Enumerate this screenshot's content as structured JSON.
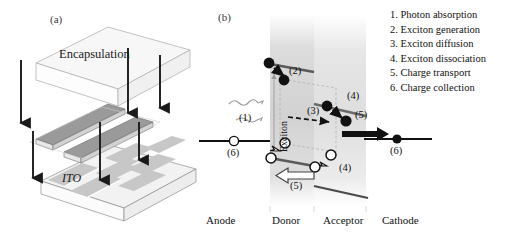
{
  "figure": {
    "panel_a": {
      "letter": "(a)",
      "encapsulation_label": "Encapsulation",
      "ito_label": "ITO",
      "arrow_count": 6,
      "description": "exploded isometric device stack with downward assembly arrows"
    },
    "panel_b": {
      "letter": "(b)",
      "exciton_label": "Exciton",
      "axis_labels": [
        "Anode",
        "Donor",
        "Acceptor",
        "Cathode"
      ],
      "step_markers": [
        "(1)",
        "(2)",
        "(3)",
        "(4)",
        "(4)",
        "(5)",
        "(5)",
        "(6)",
        "(6)"
      ],
      "marker_left_1": "(1)",
      "marker_2": "(2)",
      "marker_3": "(3)",
      "marker_4a": "(4)",
      "marker_4b": "(4)",
      "marker_5_holes": "(5)",
      "marker_5_electrons": "(5)",
      "marker_6_anode": "(6)",
      "marker_6_cathode": "(6)"
    },
    "legend": {
      "items": [
        "1. Photon absorption",
        "2. Exciton generation",
        "3. Exciton diffusion",
        "4. Exciton dissociation",
        "5. Charge transport",
        "6. Charge collection"
      ]
    },
    "colors": {
      "ink": "#111111",
      "band_line": "#555555",
      "donor_band": "#d8d8d8",
      "acceptor_band": "#e4e4e4",
      "electrode_strip": "#8a8a8a",
      "ito_pad": "#c9c9c9",
      "encapsulation": "#f4f4f4"
    }
  }
}
